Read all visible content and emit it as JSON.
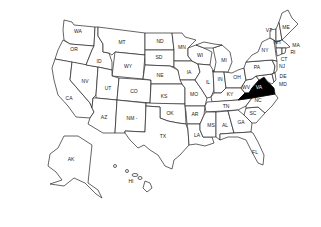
{
  "map": {
    "title": "United States",
    "highlight_color": "#000000",
    "outline_color": "#222222",
    "highlighted_state": "VA",
    "states": [
      {
        "abbr": "WA",
        "x": 78,
        "y": 33
      },
      {
        "abbr": "OR",
        "x": 74,
        "y": 51
      },
      {
        "abbr": "CA",
        "x": 69,
        "y": 100
      },
      {
        "abbr": "NV",
        "x": 85,
        "y": 83
      },
      {
        "abbr": "ID",
        "x": 99,
        "y": 62
      },
      {
        "abbr": "MT",
        "x": 122,
        "y": 43
      },
      {
        "abbr": "WY",
        "x": 127,
        "y": 67
      },
      {
        "abbr": "UT",
        "x": 108,
        "y": 89
      },
      {
        "abbr": "CO",
        "x": 134,
        "y": 92
      },
      {
        "abbr": "AZ",
        "x": 104,
        "y": 118
      },
      {
        "abbr": "NM -",
        "x": 132,
        "y": 119
      },
      {
        "abbr": "ND",
        "x": 160,
        "y": 42
      },
      {
        "abbr": "SD",
        "x": 159,
        "y": 58
      },
      {
        "abbr": "NE",
        "x": 160,
        "y": 76
      },
      {
        "abbr": "KS",
        "x": 164,
        "y": 97
      },
      {
        "abbr": "OK",
        "x": 170,
        "y": 114
      },
      {
        "abbr": "TX",
        "x": 163,
        "y": 137
      },
      {
        "abbr": "MN",
        "x": 182,
        "y": 48
      },
      {
        "abbr": "IA",
        "x": 189,
        "y": 73
      },
      {
        "abbr": "MO",
        "x": 194,
        "y": 95
      },
      {
        "abbr": "AR",
        "x": 195,
        "y": 115
      },
      {
        "abbr": "LA",
        "x": 197,
        "y": 136
      },
      {
        "abbr": "WI",
        "x": 200,
        "y": 56
      },
      {
        "abbr": "IL",
        "x": 208,
        "y": 83
      },
      {
        "abbr": "MS",
        "x": 211,
        "y": 126
      },
      {
        "abbr": "MI",
        "x": 224,
        "y": 61
      },
      {
        "abbr": "IN",
        "x": 221,
        "y": 80
      },
      {
        "abbr": "KY",
        "x": 230,
        "y": 95
      },
      {
        "abbr": "TN",
        "x": 226,
        "y": 107
      },
      {
        "abbr": "AL",
        "x": 225,
        "y": 126
      },
      {
        "abbr": "GA",
        "x": 241,
        "y": 123
      },
      {
        "abbr": "FL",
        "x": 255,
        "y": 153
      },
      {
        "abbr": "OH",
        "x": 237,
        "y": 78
      },
      {
        "abbr": "WV",
        "x": 246,
        "y": 88
      },
      {
        "abbr": "VA",
        "x": 259,
        "y": 88
      },
      {
        "abbr": "NC",
        "x": 257,
        "y": 101
      },
      {
        "abbr": "SC",
        "x": 253,
        "y": 114
      },
      {
        "abbr": "PA",
        "x": 257,
        "y": 68
      },
      {
        "abbr": "NY",
        "x": 265,
        "y": 51
      },
      {
        "abbr": "VT",
        "x": 269,
        "y": 31
      },
      {
        "abbr": "NH",
        "x": 277,
        "y": 43
      },
      {
        "abbr": "ME",
        "x": 286,
        "y": 28
      },
      {
        "abbr": "MA",
        "x": 295,
        "y": 46
      },
      {
        "abbr": "RI",
        "x": 292,
        "y": 53
      },
      {
        "abbr": "CT",
        "x": 283,
        "y": 59
      },
      {
        "abbr": "NJ",
        "x": 280,
        "y": 67
      },
      {
        "abbr": "DE",
        "x": 280,
        "y": 77
      },
      {
        "abbr": "MD",
        "x": 280,
        "y": 85
      },
      {
        "abbr": "AK",
        "x": 70,
        "y": 160
      },
      {
        "abbr": "HI",
        "x": 131,
        "y": 182
      }
    ]
  }
}
